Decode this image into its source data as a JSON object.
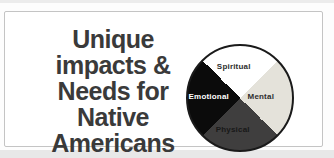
{
  "page": {
    "background": "#fdfdfd",
    "top_strip_color": "#ececec",
    "bottom_strip_color": "#e8e8e8"
  },
  "card": {
    "background": "#ffffff",
    "border_color": "#c4c4c4"
  },
  "heading": {
    "text": "Unique impacts & Needs for Native Americans",
    "lines": [
      "Unique",
      "impacts &",
      "Needs for",
      "Native",
      "Americans"
    ],
    "color": "#3a3a3a"
  },
  "chart_data": {
    "type": "pie",
    "title": "Unique impacts & Needs for Native Americans",
    "start_angle_deg": -45,
    "outline_color": "#1a1a1a",
    "legend": "none",
    "slices": [
      {
        "label": "Spiritual",
        "value": 25,
        "color": "#ffffff",
        "label_color": "#2e2e2e"
      },
      {
        "label": "Mental",
        "value": 25,
        "color": "#e4e2da",
        "label_color": "#2e2e2e"
      },
      {
        "label": "Physical",
        "value": 25,
        "color": "#3f3e3e",
        "label_color": "#181818"
      },
      {
        "label": "Emotional",
        "value": 25,
        "color": "#0b0b0b",
        "label_color": "#ffffff"
      }
    ]
  }
}
